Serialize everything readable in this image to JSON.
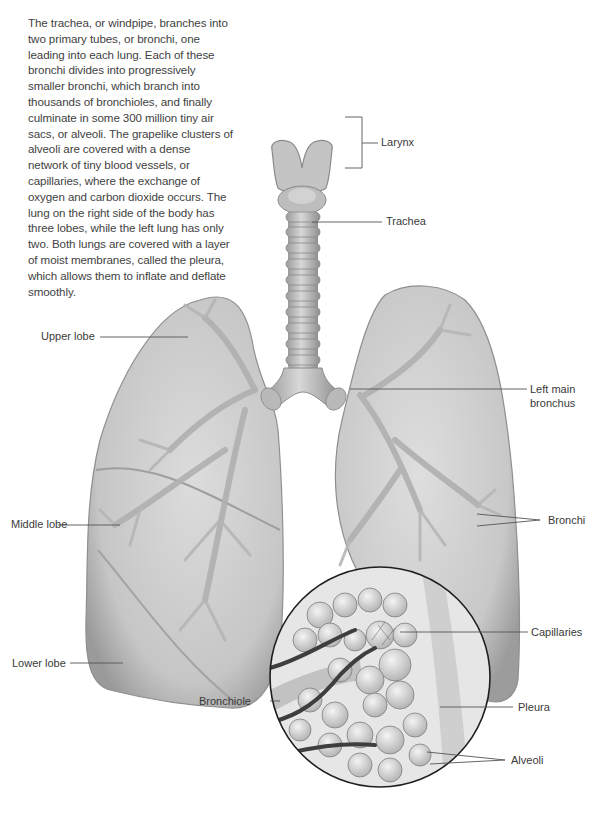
{
  "intro_text": "The trachea, or windpipe, branches into two primary tubes, or bronchi, one leading into each lung. Each of these bronchi divides into progressively smaller bronchi, which branch into thousands of bronchioles, and finally culminate in some 300 million tiny air sacs, or alveoli. The grapelike clusters of alveoli are covered with a dense network of tiny blood vessels, or capillaries, where the exchange of oxygen and carbon dioxide occurs. The lung on the right side of the body has three lobes, while the left lung has only two. Both lungs are covered with a layer of moist membranes, called the pleura, which allows them to inflate and deflate smoothly.",
  "labels": {
    "larynx": "Larynx",
    "trachea": "Trachea",
    "upper_lobe": "Upper lobe",
    "left_main_bronchus_line1": "Left main",
    "left_main_bronchus_line2": "bronchus",
    "middle_lobe": "Middle lobe",
    "bronchi": "Bronchi",
    "lower_lobe": "Lower lobe",
    "capillaries": "Capillaries",
    "bronchiole": "Bronchiole",
    "pleura": "Pleura",
    "alveoli": "Alveoli"
  },
  "colors": {
    "lung_fill": "#c9c9c9",
    "lung_edge": "#8a8a8a",
    "airway": "#b8b8b8",
    "vessel": "#4a4a4a",
    "leader_line": "#555555"
  }
}
